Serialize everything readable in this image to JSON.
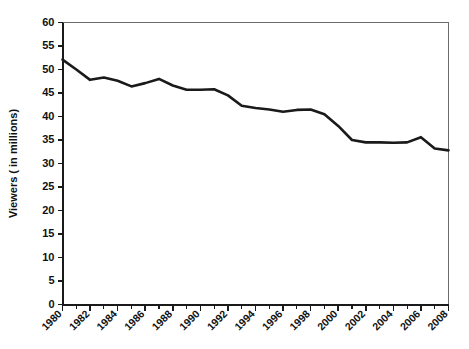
{
  "chart_data": {
    "type": "line",
    "title": "",
    "subtitle": "",
    "xlabel": "",
    "ylabel": "Viewers ( in millions)",
    "grid": true,
    "grid_axis": "y",
    "legend": "none",
    "xlim": [
      1980,
      2008
    ],
    "ylim": [
      0,
      60
    ],
    "y_tick_step": 5,
    "x_tick_step": 1,
    "x_label_step": 2,
    "line_color": "#1a1a1a",
    "grid_color": "#9a9a9a",
    "background_color": "#ffffff",
    "x": [
      1980,
      1981,
      1982,
      1983,
      1984,
      1985,
      1986,
      1987,
      1988,
      1989,
      1990,
      1991,
      1992,
      1993,
      1994,
      1995,
      1996,
      1997,
      1998,
      1999,
      2000,
      2001,
      2002,
      2003,
      2004,
      2005,
      2006,
      2007,
      2008
    ],
    "values": [
      52.1,
      50.0,
      47.8,
      48.3,
      47.6,
      46.4,
      47.1,
      48.0,
      46.6,
      45.7,
      45.7,
      45.8,
      44.5,
      42.3,
      41.8,
      41.5,
      41.0,
      41.4,
      41.5,
      40.5,
      38.0,
      35.0,
      34.5,
      34.5,
      34.4,
      34.5,
      35.6,
      33.2,
      32.8
    ],
    "series": [
      {
        "name": "Viewers",
        "values": [
          52.1,
          50.0,
          47.8,
          48.3,
          47.6,
          46.4,
          47.1,
          48.0,
          46.6,
          45.7,
          45.7,
          45.8,
          44.5,
          42.3,
          41.8,
          41.5,
          41.0,
          41.4,
          41.5,
          40.5,
          38.0,
          35.0,
          34.5,
          34.5,
          34.4,
          34.5,
          35.6,
          33.2,
          32.8
        ]
      }
    ],
    "y_tick_labels": [
      "0",
      "5",
      "10",
      "15",
      "20",
      "25",
      "30",
      "35",
      "40",
      "45",
      "50",
      "55",
      "60"
    ],
    "y_tick_values": [
      0,
      5,
      10,
      15,
      20,
      25,
      30,
      35,
      40,
      45,
      50,
      55,
      60
    ],
    "x_tick_values": [
      1980,
      1981,
      1982,
      1983,
      1984,
      1985,
      1986,
      1987,
      1988,
      1989,
      1990,
      1991,
      1992,
      1993,
      1994,
      1995,
      1996,
      1997,
      1998,
      1999,
      2000,
      2001,
      2002,
      2003,
      2004,
      2005,
      2006,
      2007,
      2008
    ],
    "x_tick_labels": [
      "1980",
      "1982",
      "1984",
      "1986",
      "1988",
      "1990",
      "1992",
      "1994",
      "1996",
      "1998",
      "2000",
      "2002",
      "2004",
      "2006",
      "2008"
    ],
    "x_label_values": [
      1980,
      1982,
      1984,
      1986,
      1988,
      1990,
      1992,
      1994,
      1996,
      1998,
      2000,
      2002,
      2004,
      2006,
      2008
    ],
    "data_points": [
      {
        "year": 1980,
        "viewers": 52.1
      },
      {
        "year": 1981,
        "viewers": 50.0
      },
      {
        "year": 1982,
        "viewers": 47.8
      },
      {
        "year": 1983,
        "viewers": 48.3
      },
      {
        "year": 1984,
        "viewers": 47.6
      },
      {
        "year": 1985,
        "viewers": 46.4
      },
      {
        "year": 1986,
        "viewers": 47.1
      },
      {
        "year": 1987,
        "viewers": 48.0
      },
      {
        "year": 1988,
        "viewers": 46.6
      },
      {
        "year": 1989,
        "viewers": 45.7
      },
      {
        "year": 1990,
        "viewers": 45.7
      },
      {
        "year": 1991,
        "viewers": 45.8
      },
      {
        "year": 1992,
        "viewers": 44.5
      },
      {
        "year": 1993,
        "viewers": 42.3
      },
      {
        "year": 1994,
        "viewers": 41.8
      },
      {
        "year": 1995,
        "viewers": 41.5
      },
      {
        "year": 1996,
        "viewers": 41.0
      },
      {
        "year": 1997,
        "viewers": 41.4
      },
      {
        "year": 1998,
        "viewers": 41.5
      },
      {
        "year": 1999,
        "viewers": 40.5
      },
      {
        "year": 2000,
        "viewers": 38.0
      },
      {
        "year": 2001,
        "viewers": 35.0
      },
      {
        "year": 2002,
        "viewers": 34.5
      },
      {
        "year": 2003,
        "viewers": 34.5
      },
      {
        "year": 2004,
        "viewers": 34.4
      },
      {
        "year": 2005,
        "viewers": 34.5
      },
      {
        "year": 2006,
        "viewers": 35.6
      },
      {
        "year": 2007,
        "viewers": 33.2
      },
      {
        "year": 2008,
        "viewers": 32.8
      }
    ]
  }
}
